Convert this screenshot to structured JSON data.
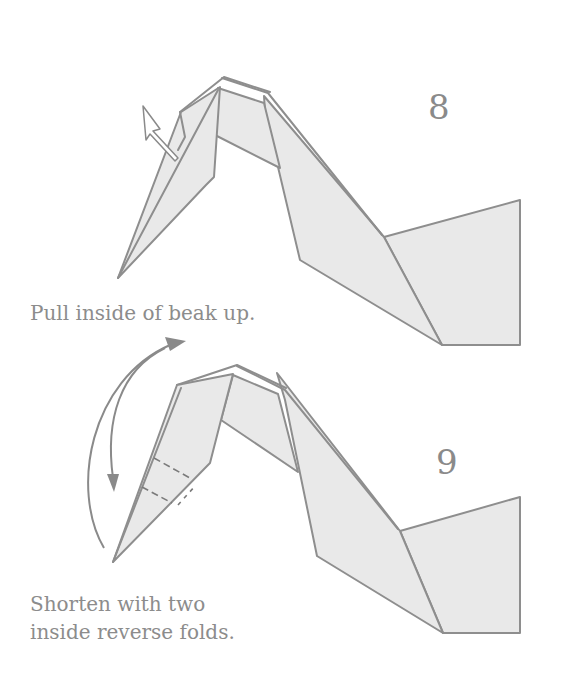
{
  "steps": [
    {
      "number": "8",
      "caption": "Pull inside of beak up.",
      "arrow_type": "hollow-pull-arrow"
    },
    {
      "number": "9",
      "caption_lines": [
        "Shorten with two",
        "inside reverse folds."
      ],
      "arrow_type": "curved-reverse-fold-arrow"
    }
  ],
  "colors": {
    "paper_fill": "#e9e9e9",
    "line": "#8e8e8e",
    "text": "#8c8c8c",
    "background": "#ffffff"
  }
}
